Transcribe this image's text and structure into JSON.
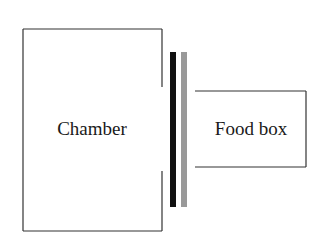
{
  "diagram": {
    "chamber": {
      "label": "Chamber",
      "x": 23,
      "y": 29,
      "width": 139,
      "height": 202,
      "opening": {
        "top_end_y": 87,
        "bottom_start_y": 171
      }
    },
    "food_box": {
      "label": "Food box",
      "x": 195,
      "y": 91,
      "right": 306,
      "bottom": 167
    },
    "barriers": [
      {
        "name": "black-barrier",
        "color": "#111111",
        "x": 170,
        "y": 52,
        "width": 6,
        "height": 155
      },
      {
        "name": "gray-barrier",
        "color": "#999999",
        "x": 181,
        "y": 52,
        "width": 6,
        "height": 155
      }
    ],
    "line_color": "#333333"
  }
}
